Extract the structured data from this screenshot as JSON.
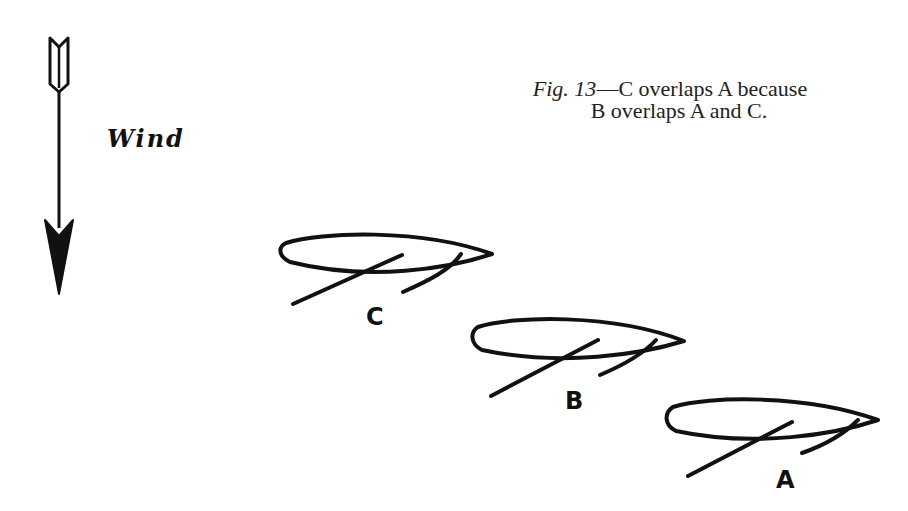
{
  "figure": {
    "caption_fig": "Fig. 13",
    "caption_dash": "—",
    "caption_line1_rest": "C overlaps A because",
    "caption_line2": "B overlaps A and C."
  },
  "wind": {
    "label": "Wind",
    "icon": "arrow-down-icon",
    "direction": "down"
  },
  "boats": [
    {
      "label": "C",
      "position": "top-left"
    },
    {
      "label": "B",
      "position": "middle"
    },
    {
      "label": "A",
      "position": "bottom-right"
    }
  ],
  "colors": {
    "ink": "#111111",
    "background": "#ffffff"
  }
}
